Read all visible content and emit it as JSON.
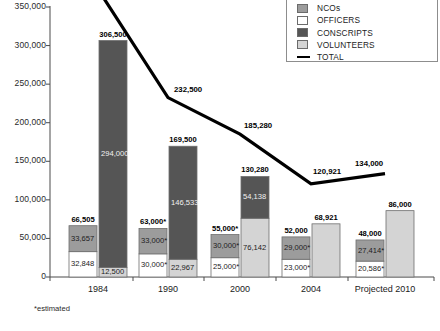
{
  "footnote": "*estimated",
  "legend": {
    "items": [
      {
        "label": "NCOs",
        "swatch": "nco-swatch",
        "color": "#9c9c9c",
        "type": "box"
      },
      {
        "label": "OFFICERS",
        "swatch": "officers-swatch",
        "color": "#ffffff",
        "type": "box"
      },
      {
        "label": "CONSCRIPTS",
        "swatch": "conscripts-swatch",
        "color": "#555555",
        "type": "box"
      },
      {
        "label": "VOLUNTEERS",
        "swatch": "volunteers-swatch",
        "color": "#d4d4d4",
        "type": "box"
      },
      {
        "label": "TOTAL",
        "swatch": "total-line-swatch",
        "color": "#000000",
        "type": "line"
      }
    ]
  },
  "chart_data": {
    "type": "bar",
    "title": "",
    "xlabel": "",
    "ylabel": "",
    "ylim": [
      0,
      350000
    ],
    "ytick_step": 50000,
    "ytick_labels": [
      "350,000",
      "300,000",
      "250,000",
      "200,000",
      "150,000",
      "100,000",
      "50,000",
      "0"
    ],
    "ytick_values": [
      350000,
      300000,
      250000,
      200000,
      150000,
      100000,
      50000,
      0
    ],
    "grid": false,
    "legend_position": "top-right",
    "categories": [
      "1984",
      "1990",
      "2000",
      "2004",
      "Projected 2010"
    ],
    "stacked_bars": [
      {
        "category": "1984",
        "bars": [
          {
            "name": "personnel",
            "total": 66505,
            "total_label": "66,505",
            "segments": [
              {
                "series": "OFFICERS",
                "value": 32848,
                "label": "32,848",
                "color": "#ffffff"
              },
              {
                "series": "NCOs",
                "value": 33657,
                "label": "33,657",
                "color": "#9c9c9c"
              }
            ]
          },
          {
            "name": "troops",
            "total": 306500,
            "total_label": "306,500",
            "segments": [
              {
                "series": "VOLUNTEERS",
                "value": 12500,
                "label": "12,500",
                "color": "#d4d4d4"
              },
              {
                "series": "CONSCRIPTS",
                "value": 294000,
                "label": "294,000",
                "color": "#555555"
              }
            ]
          }
        ]
      },
      {
        "category": "1990",
        "bars": [
          {
            "name": "personnel",
            "total": 63000,
            "total_label": "63,000*",
            "segments": [
              {
                "series": "OFFICERS",
                "value": 30000,
                "label": "30,000*",
                "color": "#ffffff"
              },
              {
                "series": "NCOs",
                "value": 33000,
                "label": "33,000*",
                "color": "#9c9c9c"
              }
            ]
          },
          {
            "name": "troops",
            "total": 169500,
            "total_label": "169,500",
            "segments": [
              {
                "series": "VOLUNTEERS",
                "value": 22967,
                "label": "22,967",
                "color": "#d4d4d4"
              },
              {
                "series": "CONSCRIPTS",
                "value": 146533,
                "label": "146,533",
                "color": "#555555"
              }
            ]
          }
        ]
      },
      {
        "category": "2000",
        "bars": [
          {
            "name": "personnel",
            "total": 55000,
            "total_label": "55,000*",
            "segments": [
              {
                "series": "OFFICERS",
                "value": 25000,
                "label": "25,000*",
                "color": "#ffffff"
              },
              {
                "series": "NCOs",
                "value": 30000,
                "label": "30,000*",
                "color": "#9c9c9c"
              }
            ]
          },
          {
            "name": "troops",
            "total": 130280,
            "total_label": "130,280",
            "segments": [
              {
                "series": "VOLUNTEERS",
                "value": 76142,
                "label": "76,142",
                "color": "#d4d4d4"
              },
              {
                "series": "CONSCRIPTS",
                "value": 54138,
                "label": "54,138",
                "color": "#555555"
              }
            ]
          }
        ]
      },
      {
        "category": "2004",
        "bars": [
          {
            "name": "personnel",
            "total": 52000,
            "total_label": "52,000",
            "segments": [
              {
                "series": "OFFICERS",
                "value": 23000,
                "label": "23,000*",
                "color": "#ffffff"
              },
              {
                "series": "NCOs",
                "value": 29000,
                "label": "29,000*",
                "color": "#9c9c9c"
              }
            ]
          },
          {
            "name": "troops",
            "total": 68921,
            "total_label": "68,921",
            "segments": [
              {
                "series": "VOLUNTEERS",
                "value": 68921,
                "label": "",
                "color": "#d4d4d4"
              }
            ]
          }
        ]
      },
      {
        "category": "Projected 2010",
        "bars": [
          {
            "name": "personnel",
            "total": 48000,
            "total_label": "48,000",
            "segments": [
              {
                "series": "OFFICERS",
                "value": 20586,
                "label": "20,586*",
                "color": "#ffffff"
              },
              {
                "series": "NCOs",
                "value": 27414,
                "label": "27,414*",
                "color": "#9c9c9c"
              }
            ]
          },
          {
            "name": "troops",
            "total": 86000,
            "total_label": "86,000",
            "segments": [
              {
                "series": "VOLUNTEERS",
                "value": 86000,
                "label": "",
                "color": "#d4d4d4"
              }
            ]
          }
        ]
      }
    ],
    "series": [
      {
        "name": "TOTAL",
        "type": "line",
        "color": "#000000",
        "values": [
          373005,
          232500,
          185280,
          120921,
          134000
        ],
        "labels": [
          "",
          "232,500",
          "185,280",
          "120,921",
          "134,000"
        ]
      }
    ]
  }
}
